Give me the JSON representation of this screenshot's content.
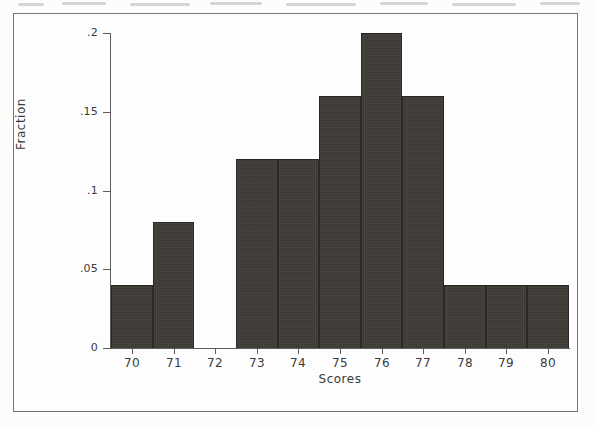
{
  "figure": {
    "frame_color": "#767676",
    "background_color": "#fefefe",
    "bar_color": "#3d3934",
    "axis_color": "#5d5d5d",
    "text_color": "#3b3b3b"
  },
  "chart_data": {
    "type": "bar",
    "title": "",
    "xlabel": "Scores",
    "ylabel": "Fraction",
    "categories": [
      70,
      71,
      72,
      73,
      74,
      75,
      76,
      77,
      78,
      79,
      80
    ],
    "values": [
      0.04,
      0.08,
      0,
      0.12,
      0.12,
      0.16,
      0.2,
      0.16,
      0.04,
      0.04,
      0.04
    ],
    "bin_width": 1,
    "xlim": [
      69.5,
      80.5
    ],
    "ylim": [
      0,
      0.2
    ],
    "xticks": [
      70,
      71,
      72,
      73,
      74,
      75,
      76,
      77,
      78,
      79,
      80
    ],
    "xtick_labels": [
      "70",
      "71",
      "72",
      "73",
      "74",
      "75",
      "76",
      "77",
      "78",
      "79",
      "80"
    ],
    "yticks": [
      0,
      0.05,
      0.1,
      0.15,
      0.2
    ],
    "ytick_labels": [
      "0",
      ".05",
      ".1",
      ".15",
      ".2"
    ],
    "grid": false,
    "legend": null,
    "bars": [
      {
        "center": 70,
        "label": "70",
        "value": 0.04
      },
      {
        "center": 71,
        "label": "71",
        "value": 0.08
      },
      {
        "center": 72,
        "label": "72",
        "value": 0
      },
      {
        "center": 73,
        "label": "73",
        "value": 0.12
      },
      {
        "center": 74,
        "label": "74",
        "value": 0.12
      },
      {
        "center": 75,
        "label": "75",
        "value": 0.16
      },
      {
        "center": 76,
        "label": "76",
        "value": 0.2
      },
      {
        "center": 77,
        "label": "77",
        "value": 0.16
      },
      {
        "center": 78,
        "label": "78",
        "value": 0.04
      },
      {
        "center": 79,
        "label": "79",
        "value": 0.04
      },
      {
        "center": 80,
        "label": "80",
        "value": 0.04
      }
    ]
  }
}
